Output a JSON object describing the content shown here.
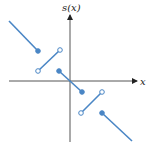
{
  "diagram": {
    "y_axis_label": "s(x)",
    "x_axis_label": "x",
    "colors": {
      "line": "#4a86c5",
      "axis": "#333333"
    },
    "segments": [
      {
        "x1": 9,
        "y1": 21,
        "x2": 38,
        "y2": 51,
        "start": "none",
        "end": "closed"
      },
      {
        "x1": 38,
        "y1": 71,
        "x2": 60,
        "y2": 50,
        "start": "open",
        "end": "open"
      },
      {
        "x1": 59,
        "y1": 71,
        "x2": 82,
        "y2": 92,
        "start": "closed",
        "end": "closed"
      },
      {
        "x1": 81,
        "y1": 113,
        "x2": 102,
        "y2": 92,
        "start": "open",
        "end": "open"
      },
      {
        "x1": 102,
        "y1": 113,
        "x2": 132,
        "y2": 141,
        "start": "closed",
        "end": "none"
      }
    ]
  }
}
